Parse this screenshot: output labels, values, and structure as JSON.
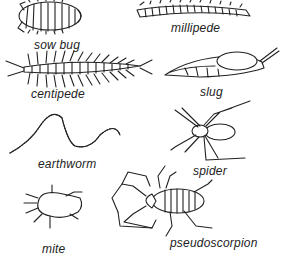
{
  "figure": {
    "type": "illustration",
    "organisms": [
      {
        "id": "sow-bug",
        "label": "sow bug"
      },
      {
        "id": "millipede",
        "label": "millipede"
      },
      {
        "id": "centipede",
        "label": "centipede"
      },
      {
        "id": "slug",
        "label": "slug"
      },
      {
        "id": "earthworm",
        "label": "earthworm"
      },
      {
        "id": "spider",
        "label": "spider"
      },
      {
        "id": "mite",
        "label": "mite"
      },
      {
        "id": "pseudoscorpion",
        "label": "pseudoscorpion"
      }
    ]
  }
}
